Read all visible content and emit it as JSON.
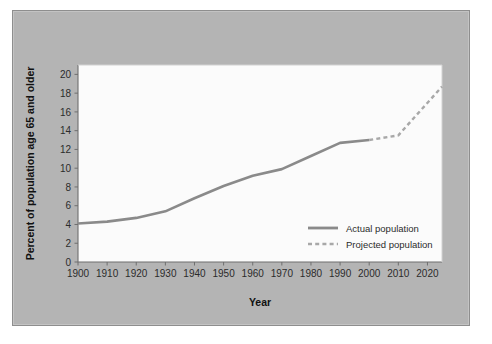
{
  "figure": {
    "panel_color": "#b4b4b4",
    "panel_border_color": "#8e8e8e",
    "page_background": "#ffffff"
  },
  "chart_data": {
    "type": "line",
    "title": "",
    "xlabel": "Year",
    "ylabel": "Percent of population age 65 and older",
    "xlim": [
      1900,
      2025
    ],
    "ylim": [
      0,
      21
    ],
    "xticks": [
      1900,
      1910,
      1920,
      1930,
      1940,
      1950,
      1960,
      1970,
      1980,
      1990,
      2000,
      2010,
      2020
    ],
    "xtick_labels": [
      "1900",
      "1910",
      "1920",
      "1930",
      "1940",
      "1950",
      "1960",
      "1970",
      "1980",
      "1990",
      "2000",
      "2010",
      "2020"
    ],
    "yticks": [
      0,
      2,
      4,
      6,
      8,
      10,
      12,
      14,
      16,
      18,
      20
    ],
    "ytick_labels": [
      "0",
      "2",
      "4",
      "6",
      "8",
      "10",
      "12",
      "14",
      "16",
      "18",
      "20"
    ],
    "grid": false,
    "legend_position": "center-right",
    "plot_background": "#fbfbfb",
    "line_color": "#8a8a8a",
    "series": [
      {
        "name": "Actual population",
        "style": "solid",
        "color": "#8a8a8a",
        "x": [
          1900,
          1910,
          1920,
          1930,
          1940,
          1950,
          1960,
          1970,
          1980,
          1990,
          2000
        ],
        "values": [
          4.1,
          4.3,
          4.7,
          5.4,
          6.8,
          8.1,
          9.2,
          9.9,
          11.3,
          12.7,
          13.0
        ]
      },
      {
        "name": "Projected population",
        "style": "dashed",
        "color": "#a8a8a8",
        "x": [
          2000,
          2010,
          2025
        ],
        "values": [
          13.0,
          13.5,
          18.7
        ]
      }
    ]
  },
  "legend": {
    "items": [
      {
        "label": "Actual population",
        "style": "solid"
      },
      {
        "label": "Projected population",
        "style": "dashed"
      }
    ]
  }
}
